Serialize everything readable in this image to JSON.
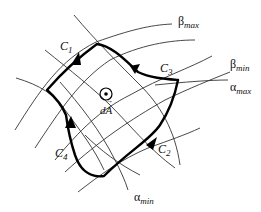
{
  "diagram": {
    "curves": [
      {
        "id": "C1",
        "label": "C",
        "sub": "1"
      },
      {
        "id": "C2",
        "label": "C",
        "sub": "2"
      },
      {
        "id": "C3",
        "label": "C",
        "sub": "3"
      },
      {
        "id": "C4",
        "label": "C",
        "sub": "4"
      }
    ],
    "coordinate_labels": {
      "beta_max": {
        "symbol": "β",
        "sub": "max"
      },
      "beta_min": {
        "symbol": "β",
        "sub": "min"
      },
      "alpha_max": {
        "symbol": "α",
        "sub": "max"
      },
      "alpha_min": {
        "symbol": "α",
        "sub": "min"
      }
    },
    "area_element": {
      "label": "dA",
      "vector_arrow": "→",
      "normal_symbol": "⊙"
    },
    "colors": {
      "lines": "#333333",
      "boundary": "#000000",
      "background": "#ffffff"
    }
  }
}
